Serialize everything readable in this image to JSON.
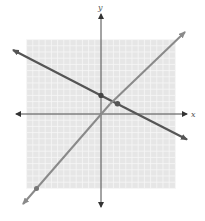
{
  "chart_data": {
    "type": "line",
    "title": "",
    "xlabel": "x",
    "ylabel": "y",
    "xlim": [
      -12,
      12
    ],
    "ylim": [
      -12,
      12
    ],
    "grid": true,
    "legend": null,
    "series": [
      {
        "name": "line-decreasing",
        "equation": "y = -1/2 x + 3",
        "slope": -0.5,
        "intercept": 3,
        "color": "#555555",
        "marked_points": [
          [
            0,
            3
          ]
        ]
      },
      {
        "name": "line-increasing",
        "equation": "y = x - 1",
        "slope": 1,
        "intercept": -1,
        "color": "#8a8a8a",
        "marked_points": [
          [
            -11,
            -12
          ]
        ]
      }
    ],
    "annotations": [
      {
        "type": "intersection",
        "x": 2.667,
        "y": 1.667
      }
    ]
  },
  "labels": {
    "x_axis": "x",
    "y_axis": "y"
  },
  "colors": {
    "grid_bg": "#e6e6e6",
    "grid_line": "#f6f6f6",
    "axis": "#333333",
    "line1": "#555555",
    "line2": "#8a8a8a"
  }
}
